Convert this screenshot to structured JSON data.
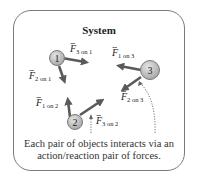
{
  "title": "System",
  "objects": [
    {
      "id": "1",
      "label": "1"
    },
    {
      "id": "2",
      "label": "2"
    },
    {
      "id": "3",
      "label": "3"
    }
  ],
  "forces": [
    {
      "symbol": "F",
      "sub": "3 on 1"
    },
    {
      "symbol": "F",
      "sub": "2 on 1"
    },
    {
      "symbol": "F",
      "sub": "1 on 3"
    },
    {
      "symbol": "F",
      "sub": "2 on 3"
    },
    {
      "symbol": "F",
      "sub": "1 on 2"
    },
    {
      "symbol": "F",
      "sub": "3 on 2"
    }
  ],
  "caption": "Each pair of objects interacts via an action/reaction pair of forces.",
  "colors": {
    "arrow": "#5a5a5a",
    "circle_fill": "#c8c8c8",
    "circle_stroke": "#7a7a7a",
    "border": "#7a7a7a"
  }
}
